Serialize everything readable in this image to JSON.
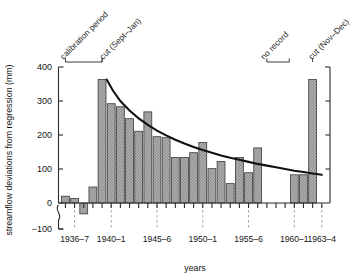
{
  "chart_data": {
    "type": "bar",
    "title": "",
    "xlabel": "years",
    "ylabel": "streamflow deviations from regression (mm)",
    "ylim": [
      -100,
      400
    ],
    "yticks": [
      -100,
      0,
      100,
      200,
      300,
      400
    ],
    "ytick_labels": [
      "−100",
      "0",
      "100",
      "200",
      "300",
      "400"
    ],
    "y_axis_break": true,
    "grid": false,
    "legend": "none",
    "categories": [
      "1935–6",
      "1936–7",
      "1937–8",
      "1938–9",
      "1939–40",
      "1940–1",
      "1941–2",
      "1942–3",
      "1943–4",
      "1944–5",
      "1945–6",
      "1946–7",
      "1947–8",
      "1948–9",
      "1949–50",
      "1950–1",
      "1951–2",
      "1952–3",
      "1953–4",
      "1954–5",
      "1955–6",
      "1956–7",
      "1957–8",
      "1958–9",
      "1959–60",
      "1960–1",
      "1961–2",
      "1962–3",
      "1963–4"
    ],
    "values": [
      20,
      13,
      -32,
      47,
      363,
      292,
      283,
      248,
      211,
      268,
      195,
      192,
      134,
      134,
      148,
      178,
      101,
      122,
      57,
      134,
      89,
      162,
      null,
      null,
      null,
      83,
      83,
      363,
      null
    ],
    "xtick_labels": [
      "1936–7",
      "1940–1",
      "1945–6",
      "1950–1",
      "1955–6",
      "1960–1",
      "1963–4"
    ],
    "xtick_categories": [
      "1936–7",
      "1940–1",
      "1945–6",
      "1950–1",
      "1955–6",
      "1960–1",
      "1963–4"
    ],
    "series": [
      {
        "name": "fitted exponential decay",
        "type": "line",
        "points": [
          [
            1939.5,
            363
          ],
          [
            1940.2,
            330
          ],
          [
            1941.0,
            300
          ],
          [
            1942.0,
            272
          ],
          [
            1943.0,
            249
          ],
          [
            1944.0,
            230
          ],
          [
            1945.0,
            213
          ],
          [
            1946.0,
            199
          ],
          [
            1947.0,
            186
          ],
          [
            1948.0,
            175
          ],
          [
            1949.0,
            165
          ],
          [
            1950.0,
            156
          ],
          [
            1951.0,
            148
          ],
          [
            1952.0,
            140
          ],
          [
            1953.0,
            133
          ],
          [
            1954.0,
            127
          ],
          [
            1955.0,
            121
          ],
          [
            1956.0,
            115
          ],
          [
            1957.0,
            110
          ],
          [
            1958.0,
            105
          ],
          [
            1959.0,
            100
          ],
          [
            1960.0,
            95
          ],
          [
            1961.0,
            91
          ],
          [
            1962.0,
            87
          ],
          [
            1963.0,
            83
          ]
        ]
      }
    ],
    "annotations": [
      {
        "id": "calibration-period",
        "text": "calibration period",
        "span": [
          "1935–6",
          "1939–40"
        ]
      },
      {
        "id": "cut-sept-jan",
        "text": "cut (Sept–Jan)",
        "span": [
          "1939–40",
          "1939–40"
        ]
      },
      {
        "id": "no-record",
        "text": "no record",
        "span": [
          "1956–7",
          "1959–60"
        ]
      },
      {
        "id": "cut-nov-dec",
        "text": "cut (Nov–Dec)",
        "span": [
          "1962–3",
          "1962–3"
        ]
      }
    ],
    "colors": {
      "bar_fill": "#a8a8a8",
      "bar_edge": "#3a3a3a",
      "curve": "#111111",
      "axis": "#2b2b2b",
      "background": "#ffffff"
    }
  }
}
